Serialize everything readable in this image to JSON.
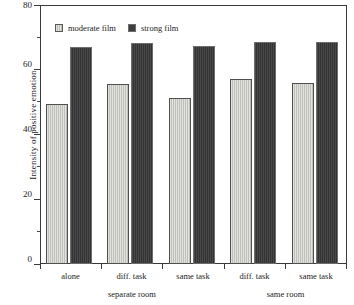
{
  "chart_data": {
    "type": "bar",
    "title": "",
    "xlabel": "",
    "ylabel": "Intensity of positive emotion",
    "ylim": [
      0,
      80
    ],
    "yticks": [
      0,
      20,
      40,
      60,
      80
    ],
    "ytick_labels": [
      "0",
      "20",
      "40",
      "60",
      "80"
    ],
    "yminor_ticks": [
      10,
      30,
      50,
      70
    ],
    "grid": false,
    "legend_position": "top-left-inside",
    "categories": [
      "alone",
      "diff. task",
      "same task",
      "diff. task",
      "same task"
    ],
    "group_labels": [
      "separate room",
      "same room"
    ],
    "group_spans": [
      3,
      2
    ],
    "series": [
      {
        "name": "moderate film",
        "color": "#c9c9c4",
        "values": [
          49.4,
          55.6,
          51.2,
          57.1,
          55.8
        ]
      },
      {
        "name": "strong film",
        "color": "#3e3e3e",
        "values": [
          67.0,
          68.2,
          67.3,
          68.5,
          68.5
        ]
      }
    ]
  },
  "axis": {
    "y_title": "Intensity of positive emotion",
    "tick_0": "0",
    "tick_20": "20",
    "tick_40": "40",
    "tick_60": "60",
    "tick_80": "80"
  },
  "legend": {
    "items": [
      {
        "label": "moderate film",
        "swatch": "light-gray-square"
      },
      {
        "label": "strong film",
        "swatch": "dark-gray-square"
      }
    ]
  },
  "categories": {
    "c0": "alone",
    "c1": "diff. task",
    "c2": "same task",
    "c3": "diff. task",
    "c4": "same task"
  },
  "groups": {
    "g0": "separate room",
    "g1": "same room"
  }
}
